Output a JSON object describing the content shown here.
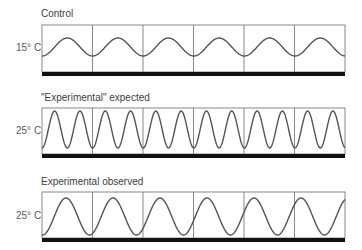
{
  "panels": [
    {
      "title": "Control",
      "temperature": "15° C",
      "box": {
        "x": 42,
        "top": 25,
        "bottom": 72,
        "right": 345
      },
      "bar": {
        "y": 72,
        "h": 4
      },
      "wave": {
        "period": 50.6,
        "amp": 9,
        "mid": 47,
        "phase_x_of_min": 42
      }
    },
    {
      "title": "\"Experimental\" expected",
      "temperature": "25° C",
      "box": {
        "x": 42,
        "top": 108,
        "bottom": 154,
        "right": 345
      },
      "bar": {
        "y": 154,
        "h": 4
      },
      "wave": {
        "period": 25.3,
        "amp": 18.5,
        "mid": 129.5,
        "phase_x_of_min": 42
      }
    },
    {
      "title": "Experimental observed",
      "temperature": "25° C",
      "box": {
        "x": 42,
        "top": 192,
        "bottom": 238,
        "right": 345
      },
      "bar": {
        "y": 238,
        "h": 4
      },
      "wave": {
        "period": 47,
        "amp": 18.5,
        "mid": 216.5,
        "phase_x_of_min": 42.5
      }
    }
  ],
  "divisions": [
    42,
    92.5,
    143,
    193.5,
    244,
    294.5,
    345
  ],
  "colors": {
    "wave": "#555555",
    "grid": "#6a6a6a",
    "bar": "#111111",
    "text": "#404040"
  }
}
